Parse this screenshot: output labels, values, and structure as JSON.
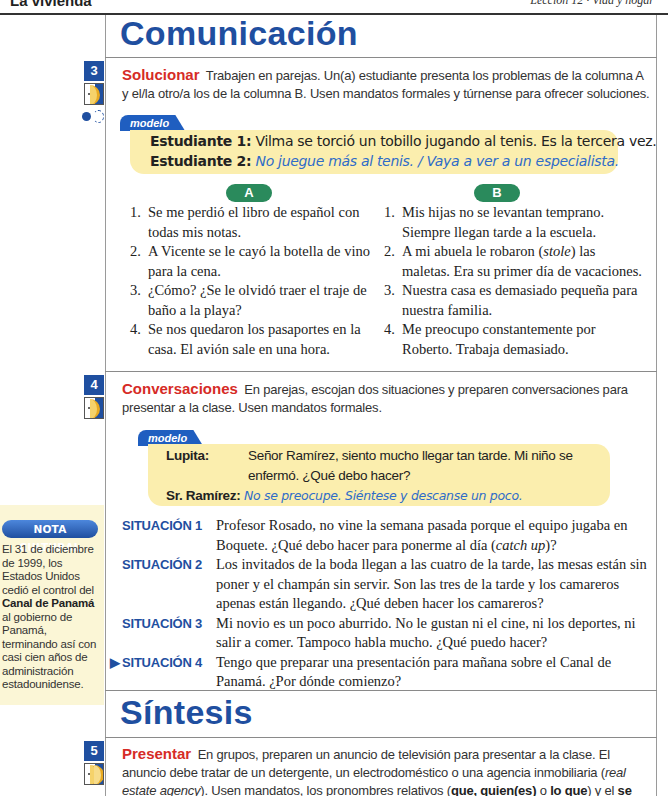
{
  "header": {
    "left_title": "La vivienda",
    "right_title": "Lección 12 · Vida y hogar"
  },
  "sections": {
    "comunicacion": "Comunicación",
    "sintesis": "Síntesis"
  },
  "activities": [
    {
      "number": "3",
      "keyword": "Solucionar",
      "instructions": " Trabajen en parejas. Un(a) estudiante presenta los problemas de la columna A y el/la otro/a los de la columna B. Usen mandatos formales y túrnense para ofrecer soluciones.",
      "modelo_label": "modelo",
      "modelo": [
        {
          "speaker": "Estudiante 1:",
          "text": "Vilma se torció un tobillo jugando al tenis. Es la tercera vez.",
          "answer": false
        },
        {
          "speaker": "Estudiante 2:",
          "text": "No juegue más al tenis. / Vaya a ver a un especialista.",
          "answer": true
        }
      ],
      "column_a": {
        "label": "A",
        "items": [
          {
            "n": "1.",
            "text": "Se me perdió el libro de español con todas mis notas."
          },
          {
            "n": "2.",
            "text": "A Vicente se le cayó la botella de vino para la cena."
          },
          {
            "n": "3.",
            "text": "¿Cómo? ¿Se le olvidó traer el traje de baño a la playa?"
          },
          {
            "n": "4.",
            "text": "Se nos quedaron los pasaportes en la casa. El avión sale en una hora."
          }
        ]
      },
      "column_b": {
        "label": "B",
        "items": [
          {
            "n": "1.",
            "text": "Mis hijas no se levantan temprano. Siempre llegan tarde a la escuela."
          },
          {
            "n": "2.",
            "text_before": "A mi abuela le robaron (",
            "italic": "stole",
            "text_after": ") las maletas. Era su primer día de vacaciones."
          },
          {
            "n": "3.",
            "text": "Nuestra casa es demasiado pequeña para nuestra familia."
          },
          {
            "n": "4.",
            "text": "Me preocupo constantemente por Roberto. Trabaja demasiado."
          }
        ]
      }
    },
    {
      "number": "4",
      "keyword": "Conversaciones",
      "instructions": " En parejas, escojan dos situaciones y preparen conversaciones para presentar a la clase. Usen mandatos formales.",
      "modelo_label": "modelo",
      "modelo": [
        {
          "speaker": "Lupita:",
          "line1": "Señor Ramírez, siento mucho llegar tan tarde. Mi niño se",
          "line2": "enfermó. ¿Qué debo hacer?"
        },
        {
          "speaker": "Sr. Ramírez:",
          "text": "No se preocupe. Siéntese y descanse un poco.",
          "answer": true
        }
      ],
      "situaciones": [
        {
          "label": "SITUACIÓN 1",
          "text_before": "Profesor Rosado, no vine la semana pasada porque el equipo jugaba en Boquete. ¿Qué debo hacer para ponerme al día (",
          "italic": "catch up",
          "text_after": ")?"
        },
        {
          "label": "SITUACIÓN 2",
          "text": "Los invitados de la boda llegan a las cuatro de la tarde, las mesas están sin poner y el champán sin servir. Son las tres de la tarde y los camareros apenas están llegando. ¿Qué deben hacer los camareros?"
        },
        {
          "label": "SITUACIÓN 3",
          "text": "Mi novio es un poco aburrido. No le gustan ni el cine, ni los deportes, ni salir a comer. Tampoco habla mucho. ¿Qué puedo hacer?"
        },
        {
          "label": "SITUACIÓN 4",
          "marker": "▶",
          "text": "Tengo que preparar una presentación para mañana sobre el Canal de Panamá. ¿Por dónde comienzo?"
        }
      ]
    },
    {
      "number": "5",
      "keyword": "Presentar",
      "p1": " En grupos, preparen un anuncio de televisión para presentar a la clase. El anuncio debe tratar de un detergente, un electrodoméstico o una agencia inmobiliaria (",
      "italic": "real estate agency",
      "p2": "). Usen mandatos, los pronombres relativos (",
      "b1": "que, quien(es)",
      "p3": " o ",
      "b2": "lo que",
      "p4": ") y el ",
      "b3": "se",
      "p5": " impersonal."
    }
  ],
  "nota_cultural": {
    "label": "NOTA CULTURAL",
    "text_before": "El 31 de diciembre de 1999, los Estados Unidos cedió el control del ",
    "bold": "Canal de Panamá",
    "text_after": " al gobierno de Panamá, terminando así con casi cien años de administración estadounidense."
  },
  "icons": [
    "pair-work-icon",
    "mouse-online-icon",
    "group-work-icon",
    "arrow-marker-icon"
  ],
  "colors": {
    "section_blue": "#1f4fa0",
    "keyword_red": "#d62b26",
    "modelo_bg": "#fbeeae",
    "column_green": "#2a8a5c",
    "answer_blue": "#2f6cc8",
    "nota_bg": "#fbf6d6"
  }
}
